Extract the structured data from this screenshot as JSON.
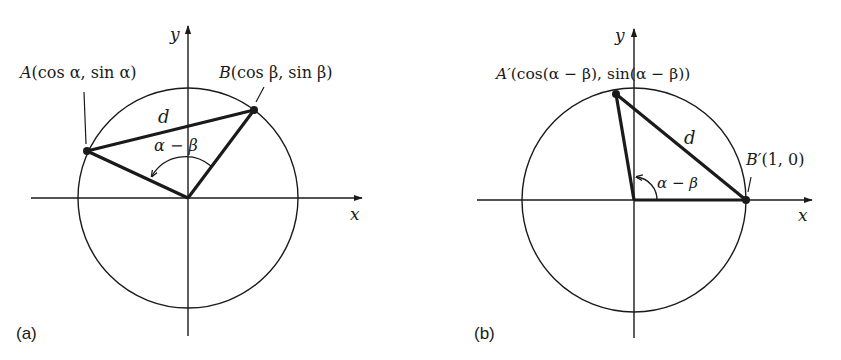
{
  "figure": {
    "colors": {
      "ink": "#1a1a1a",
      "background": "#ffffff"
    }
  },
  "panels": [
    {
      "id": "a",
      "caption": "(a)",
      "axes": {
        "x_label": "x",
        "y_label": "y"
      },
      "points": {
        "A": {
          "name": "A",
          "coords": "(cos α, sin α)"
        },
        "B": {
          "name": "B",
          "coords": "(cos β, sin β)"
        }
      },
      "segment_label": "d",
      "angle_label": "α − β"
    },
    {
      "id": "b",
      "caption": "(b)",
      "axes": {
        "x_label": "x",
        "y_label": "y"
      },
      "points": {
        "A": {
          "name": "A′",
          "coords": "(cos(α − β), sin(α − β))"
        },
        "B": {
          "name": "B′",
          "coords": "(1, 0)"
        }
      },
      "segment_label": "d",
      "angle_label": "α − β"
    }
  ]
}
